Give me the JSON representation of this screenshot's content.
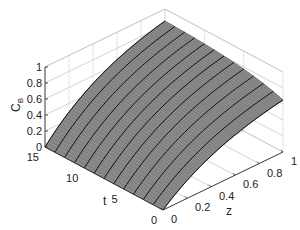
{
  "chart_data": {
    "type": "surface3d",
    "title": "",
    "xlabel": "z",
    "ylabel": "t",
    "zlabel": "C_B",
    "zlabel_main": "C",
    "zlabel_sub": "B",
    "xlim": [
      0,
      1
    ],
    "ylim": [
      0,
      15
    ],
    "zlim": [
      0,
      1
    ],
    "x_ticks": [
      "0",
      "0.2",
      "0.4",
      "0.6",
      "0.8",
      "1"
    ],
    "y_ticks": [
      "0",
      "5",
      "10",
      "15"
    ],
    "z_ticks": [
      "0",
      "0.2",
      "0.4",
      "0.6",
      "0.8",
      "1"
    ],
    "grid": true,
    "colormap": "gray",
    "surface_color": "#8a8a8a",
    "contour_color": "#111111",
    "grid_color": "#c8c8c8",
    "t_lines": 12,
    "values_description": "C_B is 0 at z=0 for all t, rises with z; at z=1 C_B ≈ 0.65 at t=0 increasing to ≈ 0.85 at t=15",
    "edge_values": {
      "z0": {
        "t0": 0.0,
        "t15": 0.0
      },
      "z1": {
        "t0": 0.65,
        "t5": 0.74,
        "t10": 0.8,
        "t15": 0.85
      }
    }
  }
}
